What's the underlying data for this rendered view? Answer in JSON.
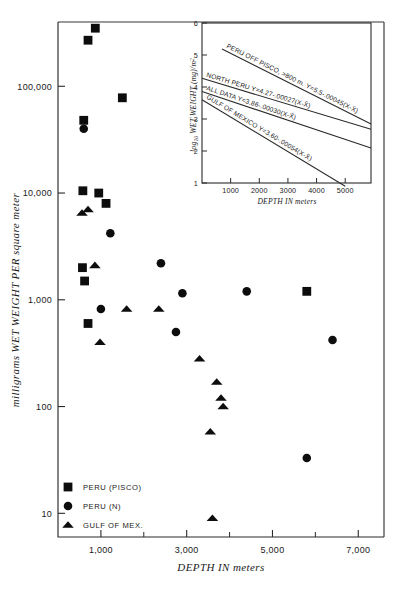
{
  "chart_data": {
    "type": "scatter",
    "title": "",
    "xlabel": "DEPTH IN meters",
    "ylabel": "milligrams WET WEIGHT PER square meter",
    "xlim": [
      0,
      7600
    ],
    "ylim": [
      6,
      400000
    ],
    "yscale": "log",
    "xscale": "linear",
    "grid": false,
    "legend_position": "lower-left-inside",
    "x_ticks_major": [
      1000,
      3000,
      5000,
      7000
    ],
    "x_tick_labels": [
      "1,000",
      "3,000",
      "5,000",
      "7,000"
    ],
    "x_ticks_minor": [
      2000,
      4000,
      6000
    ],
    "y_ticks": [
      10,
      100,
      1000,
      10000,
      100000
    ],
    "y_tick_labels": [
      "10",
      "100",
      "1,000",
      "10,000",
      "100,000"
    ],
    "series": [
      {
        "name": "PERU (PISCO)",
        "marker": "square",
        "points": [
          [
            700,
            270000
          ],
          [
            870,
            350000
          ],
          [
            1500,
            78000
          ],
          [
            600,
            48000
          ],
          [
            580,
            10500
          ],
          [
            950,
            10000
          ],
          [
            1120,
            8000
          ],
          [
            570,
            2000
          ],
          [
            620,
            1500
          ],
          [
            700,
            600
          ],
          [
            5800,
            1200
          ]
        ]
      },
      {
        "name": "PERU (N)",
        "marker": "circle",
        "points": [
          [
            600,
            40000
          ],
          [
            1220,
            4200
          ],
          [
            2900,
            1150
          ],
          [
            4400,
            1200
          ],
          [
            2400,
            2200
          ],
          [
            2750,
            500
          ],
          [
            5800,
            33
          ],
          [
            6400,
            420
          ],
          [
            1000,
            820
          ]
        ]
      },
      {
        "name": "GULF OF MEX.",
        "marker": "triangle",
        "points": [
          [
            560,
            6500
          ],
          [
            700,
            7000
          ],
          [
            860,
            2100
          ],
          [
            980,
            400
          ],
          [
            1600,
            820
          ],
          [
            2350,
            820
          ],
          [
            3300,
            280
          ],
          [
            3700,
            170
          ],
          [
            3800,
            120
          ],
          [
            3850,
            100
          ],
          [
            3550,
            58
          ],
          [
            3600,
            9
          ]
        ]
      }
    ],
    "legend": [
      {
        "label": "PERU (PISCO)",
        "marker": "square"
      },
      {
        "label": "PERU (N)",
        "marker": "circle"
      },
      {
        "label": "GULF OF MEX.",
        "marker": "triangle"
      }
    ],
    "inset": {
      "type": "line",
      "xlabel": "DEPTH IN meters",
      "ylabel": "log10 WET WEIGHT (mg)/m2",
      "ylabel_main": "WET WEIGHT (mg)/m",
      "ylabel_sub": "10",
      "ylabel_pre": "log",
      "ylabel_sup": "2",
      "xlim": [
        0,
        5900
      ],
      "ylim": [
        1,
        6
      ],
      "x_ticks": [
        1000,
        2000,
        3000,
        4000,
        5000
      ],
      "x_tick_labels": [
        "1000",
        "2000",
        "3000",
        "4000",
        "5000"
      ],
      "y_ticks": [
        1,
        2,
        3,
        4,
        5,
        6
      ],
      "y_tick_labels": [
        "1",
        "2",
        "3",
        "4",
        "5",
        "6"
      ],
      "lines": [
        {
          "name": "PERU OFF PISCO, >800 m.",
          "equation": "PERU OFF PISCO, >800 m.  Y=5.5-.00045(X-X̄)",
          "intercept": 5.5,
          "slope": -0.00045,
          "x_start": 700,
          "x_end": 5900
        },
        {
          "name": "NORTH PERU",
          "equation": "NORTH PERU   Y=4.27-.00027(X-X̄)",
          "intercept": 4.27,
          "slope": -0.00027,
          "x_start": 0,
          "x_end": 5900
        },
        {
          "name": "ALL DATA",
          "equation": "ALL DATA   Y=3.86-.00030(X-X̄)",
          "intercept": 3.86,
          "slope": -0.0003,
          "x_start": 0,
          "x_end": 5900
        },
        {
          "name": "GULF OF MEXICO",
          "equation": "GULF OF MEXICO   Y=3.60-.00054(X-X̄)",
          "intercept": 3.6,
          "slope": -0.00054,
          "x_start": 0,
          "x_end": 5000
        }
      ]
    }
  },
  "colors": {
    "ink": "#1a1a1a",
    "marker": "#0d0d0d",
    "background": "#ffffff"
  }
}
